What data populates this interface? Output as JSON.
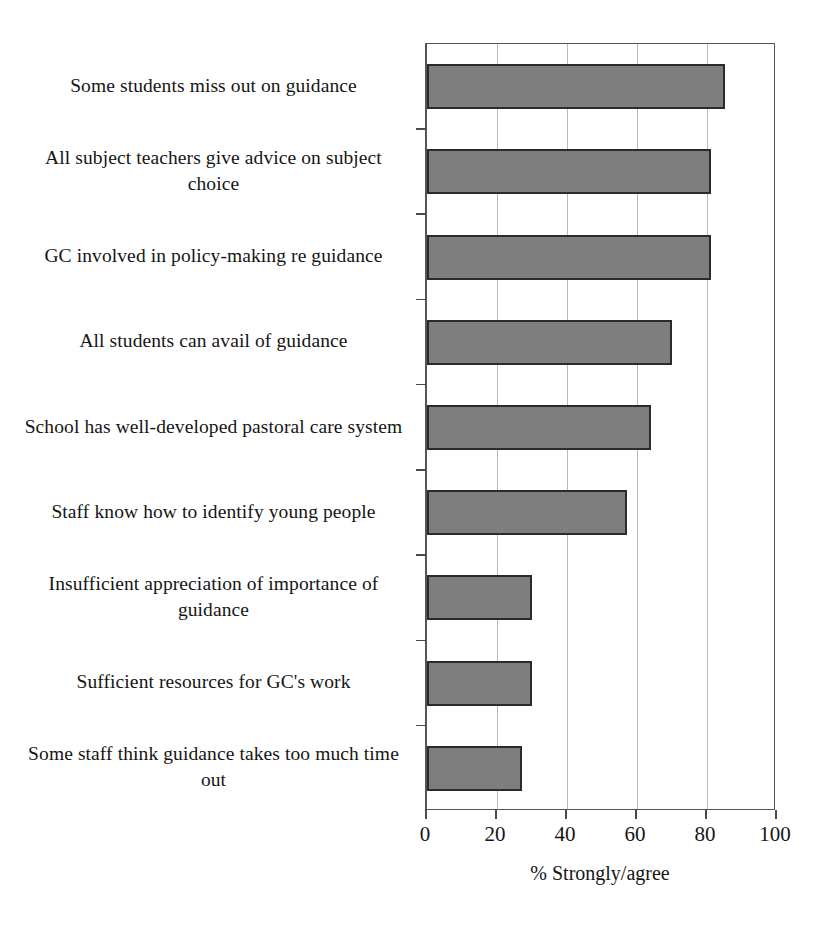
{
  "chart_data": {
    "type": "bar",
    "orientation": "horizontal",
    "title": "",
    "xlabel": "% Strongly/agree",
    "ylabel": "",
    "xlim": [
      0,
      100
    ],
    "xticks": [
      0,
      20,
      40,
      60,
      80,
      100
    ],
    "grid": "vertical gridlines at 20, 40, 60, 80",
    "legend": "none",
    "bar_fill_color": "#7e7e7e",
    "bar_border_color": "#2b2b2b",
    "categories": [
      "Some students miss out on guidance",
      "All subject teachers give advice on subject choice",
      "GC involved in policy-making re guidance",
      "All students can avail of guidance",
      "School has well-developed pastoral care system",
      "Staff know how to identify young people",
      "Insufficient appreciation of importance of guidance",
      "Sufficient resources for GC's work",
      "Some staff think guidance takes too much time out"
    ],
    "values": [
      85,
      81,
      81,
      70,
      64,
      57,
      30,
      30,
      27
    ]
  },
  "axis": {
    "tick_labels": [
      "0",
      "20",
      "40",
      "60",
      "80",
      "100"
    ],
    "title": "% Strongly/agree"
  }
}
